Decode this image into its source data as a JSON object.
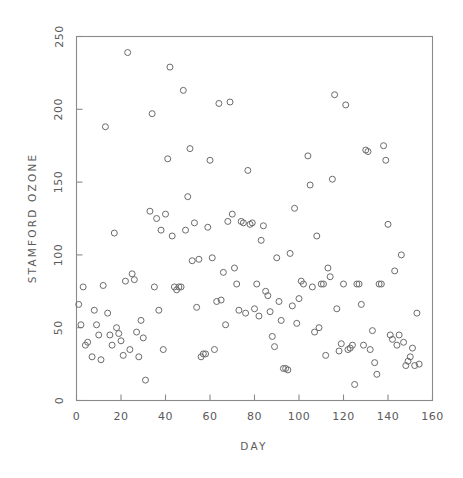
{
  "figure": {
    "background_color": "#ffffff",
    "frame_color": "#8a8a8a",
    "marker_color": "#6b6b6b",
    "text_color": "#5a5a5a"
  },
  "chart_data": {
    "type": "scatter",
    "title": "",
    "xlabel": "DAY",
    "ylabel": "STAMFORD OZONE",
    "xlim": [
      0,
      160
    ],
    "ylim": [
      0,
      250
    ],
    "xticks": [
      0,
      20,
      40,
      60,
      80,
      100,
      120,
      140,
      160
    ],
    "yticks": [
      0,
      50,
      100,
      150,
      200,
      250
    ],
    "xticklabels": [
      "0",
      "20",
      "40",
      "60",
      "80",
      "100",
      "120",
      "140",
      "160"
    ],
    "yticklabels": [
      "0",
      "50",
      "100",
      "150",
      "200",
      "250"
    ],
    "grid": false,
    "legend": null,
    "marker": "open-circle",
    "marker_size": 6,
    "n_points": 135,
    "points": [
      [
        1,
        66
      ],
      [
        2,
        52
      ],
      [
        3,
        78
      ],
      [
        4,
        38
      ],
      [
        5,
        40
      ],
      [
        7,
        30
      ],
      [
        8,
        62
      ],
      [
        9,
        52
      ],
      [
        10,
        45
      ],
      [
        11,
        28
      ],
      [
        12,
        79
      ],
      [
        13,
        188
      ],
      [
        14,
        60
      ],
      [
        15,
        45
      ],
      [
        16,
        38
      ],
      [
        17,
        115
      ],
      [
        18,
        50
      ],
      [
        19,
        46
      ],
      [
        20,
        41
      ],
      [
        21,
        31
      ],
      [
        22,
        82
      ],
      [
        23,
        239
      ],
      [
        24,
        35
      ],
      [
        25,
        87
      ],
      [
        26,
        83
      ],
      [
        27,
        47
      ],
      [
        28,
        30
      ],
      [
        29,
        55
      ],
      [
        30,
        43
      ],
      [
        31,
        14
      ],
      [
        33,
        130
      ],
      [
        34,
        197
      ],
      [
        35,
        78
      ],
      [
        36,
        125
      ],
      [
        37,
        62
      ],
      [
        38,
        117
      ],
      [
        39,
        35
      ],
      [
        40,
        128
      ],
      [
        41,
        166
      ],
      [
        42,
        229
      ],
      [
        43,
        113
      ],
      [
        44,
        78
      ],
      [
        45,
        76
      ],
      [
        46,
        78
      ],
      [
        47,
        78
      ],
      [
        48,
        213
      ],
      [
        49,
        117
      ],
      [
        50,
        140
      ],
      [
        51,
        173
      ],
      [
        52,
        96
      ],
      [
        53,
        122
      ],
      [
        54,
        64
      ],
      [
        55,
        97
      ],
      [
        56,
        30
      ],
      [
        57,
        32
      ],
      [
        58,
        32
      ],
      [
        59,
        119
      ],
      [
        60,
        165
      ],
      [
        61,
        98
      ],
      [
        62,
        35
      ],
      [
        63,
        68
      ],
      [
        64,
        204
      ],
      [
        65,
        69
      ],
      [
        66,
        88
      ],
      [
        67,
        52
      ],
      [
        68,
        123
      ],
      [
        69,
        205
      ],
      [
        70,
        128
      ],
      [
        71,
        91
      ],
      [
        72,
        80
      ],
      [
        73,
        62
      ],
      [
        74,
        123
      ],
      [
        75,
        122
      ],
      [
        76,
        60
      ],
      [
        77,
        158
      ],
      [
        78,
        121
      ],
      [
        79,
        122
      ],
      [
        80,
        63
      ],
      [
        81,
        80
      ],
      [
        82,
        58
      ],
      [
        83,
        110
      ],
      [
        84,
        120
      ],
      [
        85,
        75
      ],
      [
        86,
        72
      ],
      [
        87,
        61
      ],
      [
        88,
        44
      ],
      [
        89,
        37
      ],
      [
        90,
        98
      ],
      [
        91,
        68
      ],
      [
        92,
        55
      ],
      [
        93,
        22
      ],
      [
        94,
        22
      ],
      [
        95,
        21
      ],
      [
        96,
        101
      ],
      [
        97,
        65
      ],
      [
        98,
        132
      ],
      [
        99,
        53
      ],
      [
        100,
        70
      ],
      [
        101,
        82
      ],
      [
        102,
        80
      ],
      [
        104,
        168
      ],
      [
        105,
        148
      ],
      [
        106,
        78
      ],
      [
        107,
        47
      ],
      [
        108,
        113
      ],
      [
        109,
        50
      ],
      [
        110,
        80
      ],
      [
        111,
        80
      ],
      [
        112,
        31
      ],
      [
        113,
        91
      ],
      [
        114,
        85
      ],
      [
        115,
        152
      ],
      [
        116,
        210
      ],
      [
        117,
        63
      ],
      [
        118,
        34
      ],
      [
        119,
        39
      ],
      [
        120,
        80
      ],
      [
        121,
        203
      ],
      [
        122,
        35
      ],
      [
        123,
        36
      ],
      [
        124,
        38
      ],
      [
        125,
        11
      ],
      [
        126,
        80
      ],
      [
        127,
        80
      ],
      [
        128,
        66
      ],
      [
        129,
        38
      ],
      [
        130,
        172
      ],
      [
        131,
        171
      ],
      [
        132,
        35
      ],
      [
        133,
        48
      ],
      [
        134,
        26
      ],
      [
        135,
        18
      ],
      [
        136,
        80
      ],
      [
        137,
        80
      ],
      [
        138,
        175
      ],
      [
        139,
        165
      ],
      [
        140,
        121
      ],
      [
        141,
        45
      ],
      [
        142,
        42
      ],
      [
        143,
        89
      ],
      [
        144,
        38
      ],
      [
        145,
        45
      ],
      [
        146,
        100
      ],
      [
        147,
        40
      ],
      [
        148,
        24
      ],
      [
        149,
        27
      ],
      [
        150,
        30
      ],
      [
        151,
        36
      ],
      [
        152,
        24
      ],
      [
        153,
        60
      ],
      [
        154,
        25
      ]
    ]
  }
}
